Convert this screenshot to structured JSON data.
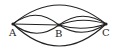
{
  "diagram": {
    "type": "multigraph",
    "nodes": [
      {
        "id": "A",
        "label": "A",
        "x": 13,
        "y": 24
      },
      {
        "id": "B",
        "label": "B",
        "x": 59,
        "y": 25
      },
      {
        "id": "C",
        "label": "C",
        "x": 106,
        "y": 24
      }
    ],
    "edges": [
      {
        "from": "A",
        "to": "C",
        "shape": "arc-up-large"
      },
      {
        "from": "A",
        "to": "C",
        "shape": "arc-down-large"
      },
      {
        "from": "A",
        "to": "B",
        "shape": "arc-up"
      },
      {
        "from": "A",
        "to": "B",
        "shape": "straight"
      },
      {
        "from": "A",
        "to": "B",
        "shape": "arc-down"
      },
      {
        "from": "B",
        "to": "C",
        "shape": "arc-up"
      },
      {
        "from": "B",
        "to": "C",
        "shape": "arc-up-shallow"
      },
      {
        "from": "B",
        "to": "C",
        "shape": "arc-down-shallow"
      },
      {
        "from": "B",
        "to": "C",
        "shape": "arc-down"
      }
    ],
    "stroke_color": "#222222"
  }
}
